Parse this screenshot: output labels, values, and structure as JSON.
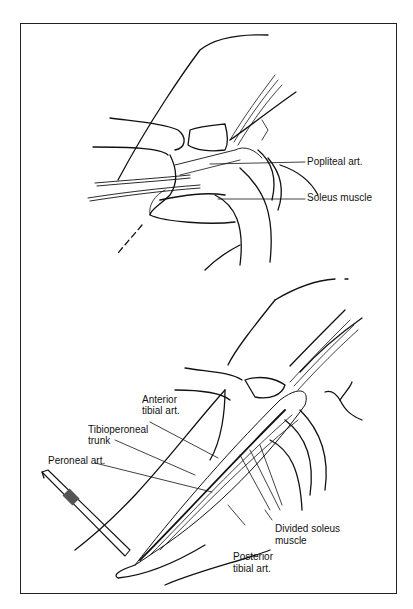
{
  "figure": {
    "top_panel": {
      "labels": {
        "popliteal": "Popliteal art.",
        "soleus": "Soleus muscle"
      }
    },
    "bottom_panel": {
      "labels": {
        "anterior_1": "Anterior",
        "anterior_2": "tibial art.",
        "tibioperoneal_1": "Tibioperoneal",
        "tibioperoneal_2": "trunk",
        "peroneal": "Peroneal art.",
        "divided_1": "Divided soleus",
        "divided_2": "muscle",
        "posterior_1": "Posterior",
        "posterior_2": "tibial art."
      }
    }
  }
}
